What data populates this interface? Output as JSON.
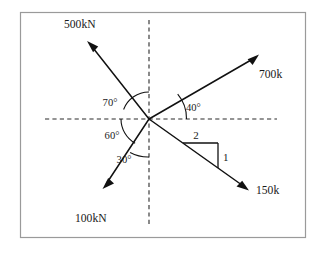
{
  "figure": {
    "frame": {
      "x": 20,
      "y": 12,
      "width": 285,
      "height": 225,
      "stroke": "#9a9a9a"
    },
    "origin": {
      "x": 149,
      "y": 119
    },
    "background": "#ffffff",
    "ink": "#111111"
  },
  "axes": {
    "horizontal": {
      "x1": 45,
      "y1": 119,
      "x2": 277,
      "y2": 119,
      "style": "dashed"
    },
    "vertical": {
      "x1": 149,
      "y1": 20,
      "x2": 149,
      "y2": 225,
      "style": "dashed"
    }
  },
  "forces": [
    {
      "id": "force-500kn",
      "label": "500kN",
      "magnitude": 500,
      "unit": "kN",
      "direction": "up-left",
      "angle_from_vertical_deg": 70,
      "tail": {
        "x": 149,
        "y": 119
      },
      "tip": {
        "x": 88,
        "y": 42
      },
      "label_pos": {
        "x": 64,
        "y": 28
      }
    },
    {
      "id": "force-700k",
      "label": "700k",
      "magnitude": 700,
      "unit": "k",
      "direction": "up-right",
      "angle_from_horizontal_deg": 40,
      "tail": {
        "x": 149,
        "y": 119
      },
      "tip": {
        "x": 258,
        "y": 55
      },
      "label_pos": {
        "x": 259,
        "y": 78
      }
    },
    {
      "id": "force-150k",
      "label": "150k",
      "magnitude": 150,
      "unit": "k",
      "direction": "down-right",
      "slope_run": 2,
      "slope_rise": 1,
      "tail": {
        "x": 149,
        "y": 119
      },
      "tip": {
        "x": 248,
        "y": 190
      },
      "label_pos": {
        "x": 256,
        "y": 194
      }
    },
    {
      "id": "force-100kn",
      "label": "100kN",
      "magnitude": 100,
      "unit": "kN",
      "direction": "down-left",
      "angle_from_vertical_deg": 30,
      "tail": {
        "x": 149,
        "y": 119
      },
      "tip": {
        "x": 103,
        "y": 188
      },
      "label_pos": {
        "x": 75,
        "y": 222
      }
    }
  ],
  "angles": [
    {
      "id": "angle-70",
      "label": "70°",
      "value": 70,
      "between": [
        "vertical-up-axis",
        "force-500kn"
      ],
      "label_pos": {
        "x": 110,
        "y": 106
      }
    },
    {
      "id": "angle-60",
      "label": "60°",
      "value": 60,
      "between": [
        "horizontal-left-axis",
        "force-100kn"
      ],
      "label_pos": {
        "x": 112,
        "y": 139
      }
    },
    {
      "id": "angle-30",
      "label": "30°",
      "value": 30,
      "between": [
        "force-100kn",
        "vertical-down-axis"
      ],
      "label_pos": {
        "x": 124,
        "y": 163
      }
    },
    {
      "id": "angle-40",
      "label": "40°",
      "value": 40,
      "between": [
        "force-700k",
        "horizontal-right-axis"
      ],
      "label_pos": {
        "x": 186,
        "y": 111
      }
    }
  ],
  "slope_triangle": {
    "id": "slope-triangle-150k",
    "run_label": "2",
    "rise_label": "1",
    "run_value": 2,
    "rise_value": 1,
    "vertices": {
      "left": {
        "x": 183,
        "y": 143
      },
      "top_right": {
        "x": 218,
        "y": 143
      },
      "bottom_right": {
        "x": 218,
        "y": 168
      }
    },
    "run_label_pos": {
      "x": 196,
      "y": 139
    },
    "rise_label_pos": {
      "x": 223,
      "y": 161
    }
  }
}
